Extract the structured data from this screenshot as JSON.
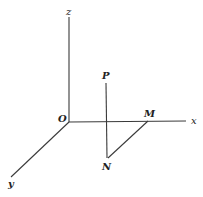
{
  "figure": {
    "type": "3d-coordinate-diagram",
    "background": "#ffffff",
    "line_color": "#3a3a3a",
    "labels": {
      "z": "z",
      "x": "x",
      "y": "y",
      "O": "O",
      "P": "P",
      "M": "M",
      "N": "N"
    },
    "points": {
      "O": [
        69,
        122
      ],
      "z_end": [
        69,
        17
      ],
      "x_end": [
        186,
        121
      ],
      "y_end": [
        11,
        177
      ],
      "P": [
        106,
        83
      ],
      "N": [
        108,
        158
      ],
      "M": [
        148,
        121
      ]
    },
    "segments": [
      {
        "name": "z-axis",
        "from": "O",
        "to": "z_end"
      },
      {
        "name": "x-axis",
        "from": "O",
        "to": "x_end"
      },
      {
        "name": "y-axis",
        "from": "O",
        "to": "y_end"
      },
      {
        "name": "PN",
        "from": "P",
        "to": "N"
      },
      {
        "name": "NM",
        "from": "N",
        "to": "M"
      }
    ]
  }
}
